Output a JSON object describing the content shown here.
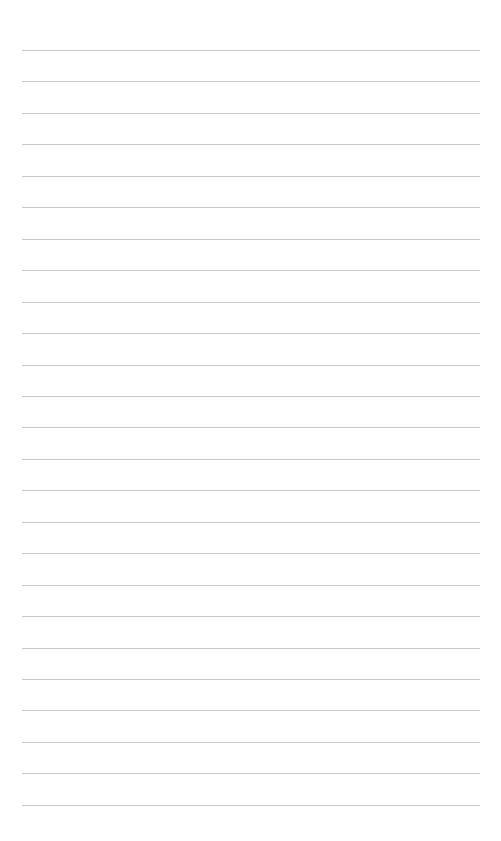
{
  "page": {
    "type": "lined-paper",
    "background_color": "#ffffff",
    "line_color": "#c8c8c8",
    "line_count": 25,
    "first_line_y": 50,
    "line_spacing": 31.45,
    "line_left": 22,
    "line_right": 480
  }
}
